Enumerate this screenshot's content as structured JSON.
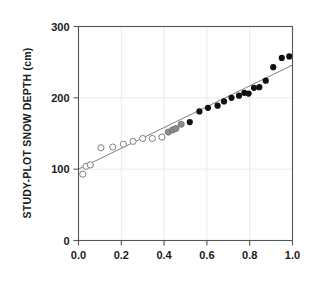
{
  "chart_data": {
    "type": "scatter",
    "title": "",
    "subtitle": "",
    "xlabel": "",
    "ylabel": "STUDY-PLOT SNOW DEPTH (cm)",
    "xlim": [
      0.0,
      1.0
    ],
    "ylim": [
      0,
      300
    ],
    "xticks": [
      "0.0",
      "0.2",
      "0.4",
      "0.6",
      "0.8",
      "1.0"
    ],
    "xtick_values": [
      0.0,
      0.2,
      0.4,
      0.6,
      0.8,
      1.0
    ],
    "yticks": [
      "0",
      "100",
      "200",
      "300"
    ],
    "ytick_values": [
      0,
      100,
      200,
      300
    ],
    "grid": "light gridlines at x=0.2,0.4,0.6,0.8 and y=100,200",
    "legend": "none",
    "marker_colors": {
      "open": "#ffffff",
      "open_edge": "#808080",
      "gray": "#8c8c8c",
      "filled": "#111111",
      "line": "#808080"
    },
    "series": [
      {
        "name": "open-circles",
        "style": "open",
        "points": [
          [
            0.02,
            93
          ],
          [
            0.035,
            104
          ],
          [
            0.055,
            106
          ],
          [
            0.105,
            130
          ],
          [
            0.16,
            131
          ],
          [
            0.21,
            135
          ],
          [
            0.255,
            139
          ],
          [
            0.3,
            143
          ],
          [
            0.345,
            143
          ],
          [
            0.39,
            145
          ]
        ]
      },
      {
        "name": "gray-circles",
        "style": "gray",
        "points": [
          [
            0.42,
            152
          ],
          [
            0.44,
            155
          ],
          [
            0.455,
            157
          ],
          [
            0.48,
            163
          ]
        ]
      },
      {
        "name": "filled-circles",
        "style": "filled",
        "points": [
          [
            0.52,
            166
          ],
          [
            0.565,
            181
          ],
          [
            0.605,
            186
          ],
          [
            0.65,
            189
          ],
          [
            0.68,
            195
          ],
          [
            0.715,
            200
          ],
          [
            0.75,
            203
          ],
          [
            0.775,
            207
          ],
          [
            0.795,
            206
          ],
          [
            0.82,
            214
          ],
          [
            0.845,
            215
          ],
          [
            0.875,
            224
          ],
          [
            0.91,
            243
          ],
          [
            0.95,
            256
          ],
          [
            0.985,
            258
          ]
        ]
      }
    ],
    "fit_line": {
      "name": "regression-line",
      "x0": 0.0,
      "y0": 100,
      "x1": 1.0,
      "y1": 246
    }
  }
}
